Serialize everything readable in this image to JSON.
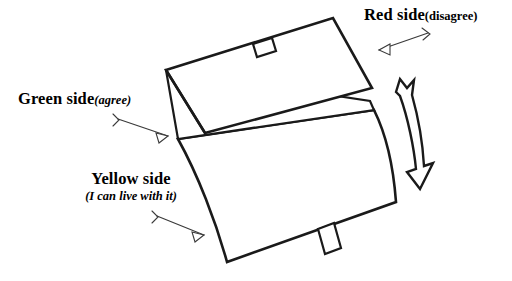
{
  "figure": {
    "background_color": "#ffffff",
    "line_color": "#1a1a1a",
    "leader_color": "#3a3a3a"
  },
  "labels": {
    "red": {
      "main": "Red side",
      "sub": "(disagree)",
      "sub_open": "(",
      "sub_word": "disagree",
      "sub_close": ")"
    },
    "green": {
      "main": "Green side",
      "sub": "(agree)",
      "sub_open": "(",
      "sub_word": "agree",
      "sub_close": ")"
    },
    "yellow": {
      "main": "Yellow side",
      "sub": "(I can live with it)",
      "sub_open": "(",
      "sub_word": "I can live with it",
      "sub_close": ")"
    }
  },
  "parts": {
    "top_flap": "top-flap-panel",
    "inner_strip": "inner-fold-strip",
    "bottom_panel": "bottom-curved-panel",
    "top_tab": "top-edge-tab",
    "bottom_tab": "bottom-edge-tab",
    "motion_arrow": "double-headed-curved-arrow"
  },
  "annotations": {
    "red_leader": "leader-arrow-to-red-side",
    "green_leader": "leader-arrow-to-green-side",
    "yellow_leader": "leader-arrow-to-yellow-side"
  }
}
